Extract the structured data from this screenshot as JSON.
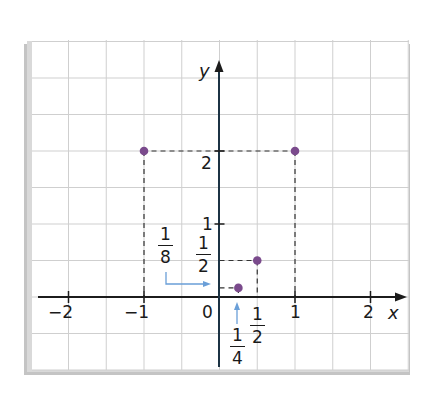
{
  "chart_data": {
    "type": "scatter",
    "title": "",
    "xlabel": "x",
    "ylabel": "y",
    "xlim": [
      -2.5,
      2.5
    ],
    "ylim": [
      -1,
      3
    ],
    "grid": true,
    "grid_step": 0.5,
    "x_ticks": [
      -2,
      -1,
      0,
      1,
      2
    ],
    "x_tick_labels": [
      "−2",
      "−1",
      "0",
      "1",
      "2"
    ],
    "y_ticks": [
      1,
      2
    ],
    "y_tick_labels": [
      "1",
      "2"
    ],
    "points": [
      {
        "x": -1,
        "y": 2
      },
      {
        "x": 1,
        "y": 2
      },
      {
        "x": 0.5,
        "y": 0.5
      },
      {
        "x": 0.25,
        "y": 0.125
      }
    ],
    "annotations": [
      {
        "text": "1/8",
        "num": "1",
        "den": "8",
        "points_to": "y = 1/8 on y-axis",
        "arrow": "blue"
      },
      {
        "text": "1/2",
        "num": "1",
        "den": "2",
        "position": "y = 1/2 on y-axis"
      },
      {
        "text": "1/4",
        "num": "1",
        "den": "4",
        "points_to": "x = 1/4 on x-axis",
        "arrow": "blue"
      },
      {
        "text": "1/2",
        "num": "1",
        "den": "2",
        "position": "x = 1/2 on x-axis"
      }
    ],
    "dashed_guides": true
  },
  "labels": {
    "x_axis": "x",
    "y_axis": "y",
    "origin": "0",
    "x_neg2": "−2",
    "x_neg1": "−1",
    "x_1": "1",
    "x_2": "2",
    "y_1": "1",
    "y_2": "2",
    "frac_eighth": {
      "num": "1",
      "den": "8"
    },
    "frac_half_y": {
      "num": "1",
      "den": "2"
    },
    "frac_quarter": {
      "num": "1",
      "den": "4"
    },
    "frac_half_x": {
      "num": "1",
      "den": "2"
    }
  },
  "colors": {
    "point": "#7a4a8c",
    "axis": "#1c3344",
    "grid": "#cfcfcf",
    "guide": "#333333",
    "arrow": "#6a9fd8",
    "shadow": "#bdbdbd"
  }
}
